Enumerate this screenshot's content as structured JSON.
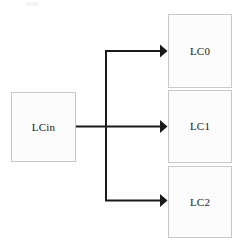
{
  "diagram": {
    "type": "block-diagram",
    "canvas": {
      "width": 242,
      "height": 252,
      "background": "#ffffff"
    },
    "style": {
      "node_fill": "#fcfcfc",
      "node_border": "#c9c9c9",
      "edge_color": "#1a1a1a",
      "label_color": "#1a1a1a"
    },
    "nodes": [
      {
        "id": "lcin",
        "label": "LCin",
        "x": 11,
        "y": 92,
        "width": 65,
        "height": 70
      },
      {
        "id": "lc0",
        "label": "LC0",
        "x": 168,
        "y": 14,
        "width": 64,
        "height": 74
      },
      {
        "id": "lc1",
        "label": "LC1",
        "x": 168,
        "y": 90,
        "width": 64,
        "height": 73
      },
      {
        "id": "lc2",
        "label": "LC2",
        "x": 168,
        "y": 166,
        "width": 64,
        "height": 72
      }
    ],
    "edges": [
      {
        "id": "edge-lcin-lc0",
        "from": "lcin",
        "to": "lc0",
        "label": "",
        "route": "elbow-up",
        "arrowhead": "solid-triangle"
      },
      {
        "id": "edge-lcin-lc1",
        "from": "lcin",
        "to": "lc1",
        "label": "",
        "route": "straight",
        "arrowhead": "solid-triangle"
      },
      {
        "id": "edge-lcin-lc2",
        "from": "lcin",
        "to": "lc2",
        "label": "",
        "route": "elbow-down",
        "arrowhead": "solid-triangle"
      }
    ]
  }
}
